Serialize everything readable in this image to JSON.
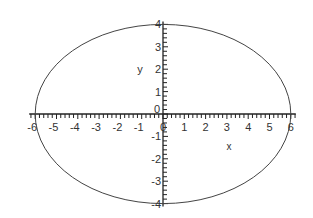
{
  "chart_data": {
    "type": "line",
    "title": "",
    "series": [
      {
        "name": "ellipse",
        "equation": "x^2/36 + y^2/16 = 1",
        "a": 6,
        "b": 4,
        "center": [
          0,
          0
        ]
      }
    ],
    "xlabel": "x",
    "ylabel": "y",
    "xlim": [
      -6,
      6
    ],
    "ylim": [
      -4,
      4
    ],
    "x_ticks": [
      "-6",
      "-5",
      "-4",
      "-3",
      "-2",
      "-1",
      "0",
      "1",
      "2",
      "3",
      "4",
      "5",
      "6"
    ],
    "y_ticks": [
      "-4",
      "-3",
      "-2",
      "-1",
      "0",
      "1",
      "2",
      "3",
      "4"
    ],
    "minor_tick_step": 0.2,
    "grid": false,
    "legend": null
  },
  "colors": {
    "curve": "#444444",
    "axis": "#222222",
    "text": "#333333"
  }
}
